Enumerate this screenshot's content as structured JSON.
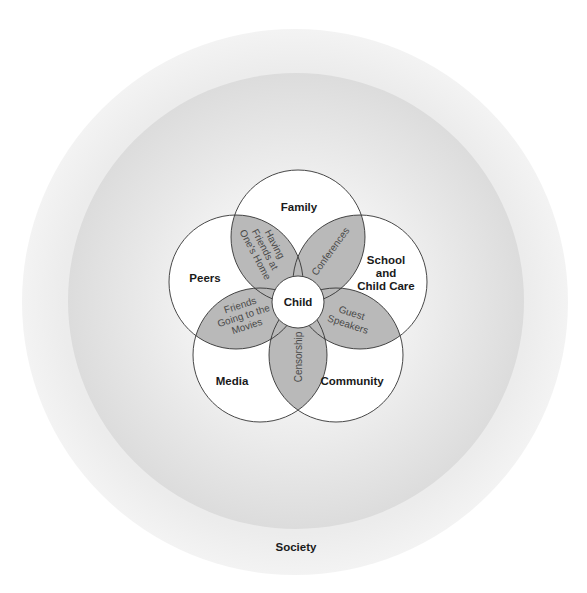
{
  "diagram": {
    "type": "nested-circles-venn",
    "outer_ring": {
      "label": "Society"
    },
    "center": {
      "label": "Child"
    },
    "systems": [
      {
        "id": "family",
        "label_lines": [
          "Family"
        ]
      },
      {
        "id": "school",
        "label_lines": [
          "School",
          "and",
          "Child Care"
        ]
      },
      {
        "id": "community",
        "label_lines": [
          "Community"
        ]
      },
      {
        "id": "media",
        "label_lines": [
          "Media"
        ]
      },
      {
        "id": "peers",
        "label_lines": [
          "Peers"
        ]
      }
    ],
    "overlaps": [
      {
        "between": [
          "peers",
          "family"
        ],
        "label_lines": [
          "Having",
          "Friends at",
          "One's Home"
        ]
      },
      {
        "between": [
          "family",
          "school"
        ],
        "label_lines": [
          "Conferences"
        ]
      },
      {
        "between": [
          "school",
          "community"
        ],
        "label_lines": [
          "Guest",
          "Speakers"
        ]
      },
      {
        "between": [
          "community",
          "media"
        ],
        "label_lines": [
          "Censorship"
        ]
      },
      {
        "between": [
          "media",
          "peers"
        ],
        "label_lines": [
          "Friends",
          "Going to the",
          "Movies"
        ]
      }
    ],
    "colors": {
      "background": "#ffffff",
      "society_ring": "#ebebeb",
      "inner_ring": "#e2e2e2",
      "system_fill": "#ffffff",
      "overlap_fill": "#b9b9b9",
      "stroke": "#333333",
      "label_text": "#1a1a1a",
      "overlap_text": "#4a4a4a"
    }
  }
}
